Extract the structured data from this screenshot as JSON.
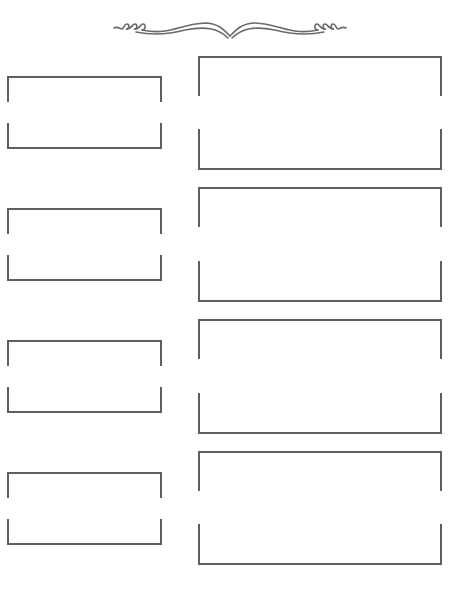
{
  "page": {
    "background": "#ffffff",
    "line_color": "#5e5e5e",
    "ornament": {
      "icon": "scroll-flourish-icon"
    }
  },
  "rows": [
    {
      "left": {
        "label": "",
        "top": 76,
        "height": 73,
        "top_bracket": 26,
        "bottom_bracket": 26
      },
      "right": {
        "label": "",
        "top": 56,
        "height": 114,
        "top_bracket": 40,
        "bottom_bracket": 41
      }
    },
    {
      "left": {
        "label": "",
        "top": 208,
        "height": 73,
        "top_bracket": 26,
        "bottom_bracket": 26
      },
      "right": {
        "label": "",
        "top": 187,
        "height": 115,
        "top_bracket": 40,
        "bottom_bracket": 41
      }
    },
    {
      "left": {
        "label": "",
        "top": 340,
        "height": 73,
        "top_bracket": 26,
        "bottom_bracket": 26
      },
      "right": {
        "label": "",
        "top": 319,
        "height": 115,
        "top_bracket": 40,
        "bottom_bracket": 41
      }
    },
    {
      "left": {
        "label": "",
        "top": 472,
        "height": 73,
        "top_bracket": 26,
        "bottom_bracket": 26
      },
      "right": {
        "label": "",
        "top": 451,
        "height": 114,
        "top_bracket": 40,
        "bottom_bracket": 41
      }
    }
  ]
}
